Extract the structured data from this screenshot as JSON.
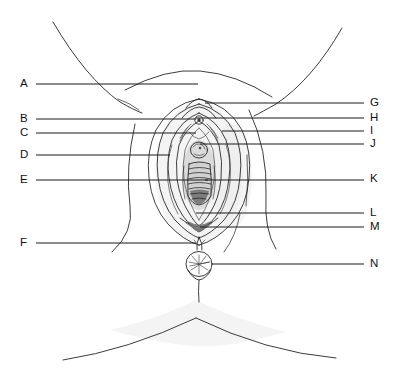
{
  "diagram": {
    "style": "line drawing, unlabeled letter key",
    "background_color": "#ffffff",
    "ink_color": "#1a1a1a",
    "width": 396,
    "height": 389
  },
  "labels_left": [
    {
      "letter": "A",
      "x": 20,
      "y": 77,
      "line_from_x": 36,
      "line_to_x": 198,
      "line_y": 84
    },
    {
      "letter": "B",
      "x": 20,
      "y": 112,
      "line_from_x": 36,
      "line_to_x": 196,
      "line_y": 119
    },
    {
      "letter": "C",
      "x": 20,
      "y": 126,
      "line_from_x": 36,
      "line_to_x": 196,
      "line_y": 133
    },
    {
      "letter": "D",
      "x": 20,
      "y": 148,
      "line_from_x": 36,
      "line_to_x": 170,
      "line_y": 155
    },
    {
      "letter": "E",
      "x": 20,
      "y": 173,
      "line_from_x": 36,
      "line_to_x": 208,
      "line_y": 180
    },
    {
      "letter": "F",
      "x": 20,
      "y": 236,
      "line_from_x": 36,
      "line_to_x": 196,
      "line_y": 243
    }
  ],
  "labels_right": [
    {
      "letter": "G",
      "x": 370,
      "y": 96,
      "line_from_x": 205,
      "line_to_x": 364,
      "line_y": 103
    },
    {
      "letter": "H",
      "x": 370,
      "y": 111,
      "line_from_x": 196,
      "line_to_x": 364,
      "line_y": 118
    },
    {
      "letter": "I",
      "x": 370,
      "y": 124,
      "line_from_x": 222,
      "line_to_x": 364,
      "line_y": 131
    },
    {
      "letter": "J",
      "x": 370,
      "y": 137,
      "line_from_x": 200,
      "line_to_x": 364,
      "line_y": 144
    },
    {
      "letter": "K",
      "x": 370,
      "y": 172,
      "line_from_x": 205,
      "line_to_x": 364,
      "line_y": 180
    },
    {
      "letter": "L",
      "x": 370,
      "y": 206,
      "line_from_x": 196,
      "line_to_x": 364,
      "line_y": 213
    },
    {
      "letter": "M",
      "x": 370,
      "y": 220,
      "line_from_x": 200,
      "line_to_x": 364,
      "line_y": 227
    },
    {
      "letter": "N",
      "x": 370,
      "y": 257,
      "line_from_x": 212,
      "line_to_x": 364,
      "line_y": 264
    }
  ],
  "figure_parts": [
    "left-thigh-contour",
    "right-thigh-contour",
    "mons-pubis-arc",
    "labia-majora-outer",
    "labia-minora-contours",
    "clitoral-hood",
    "clitoral-glans",
    "urethral-opening",
    "vaginal-opening",
    "hymenal-ring",
    "fourchette",
    "perineum",
    "anus",
    "gluteal-fold-left",
    "gluteal-fold-right"
  ]
}
